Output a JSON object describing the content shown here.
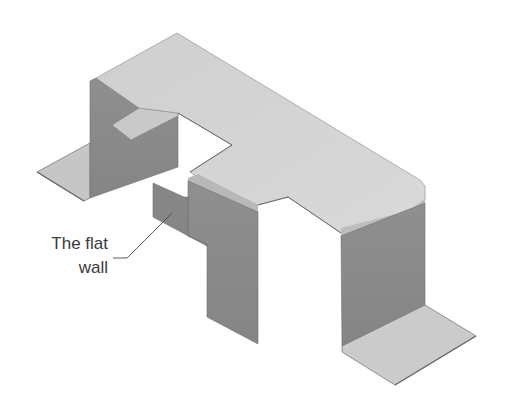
{
  "figure": {
    "colors": {
      "background": "#ffffff",
      "top_face": "#c9c9c9",
      "top_face_light": "#d6d6d6",
      "side_wall": "#8c8c8c",
      "side_wall_dark": "#7a7a7a",
      "flange": "#c4c4c4",
      "edge": "#6a6a6a",
      "leader_line": "#4a4a4a",
      "label_text": "#3a3a3a"
    }
  },
  "callout": {
    "line1": "The flat",
    "line2": "wall",
    "target": "flat wall"
  }
}
